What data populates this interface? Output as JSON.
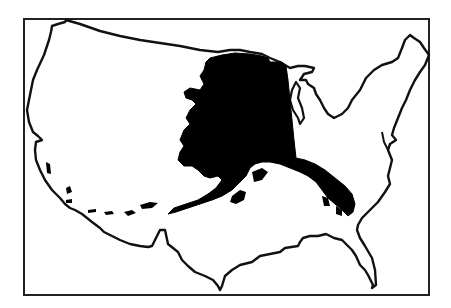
{
  "map": {
    "subject": "Alaska overlaid on the contiguous United States (size comparison)",
    "labels": [],
    "colors": {
      "background": "#ffffff",
      "outline": "#111111",
      "alaska_fill": "#000000",
      "frame": "#222222"
    },
    "frame": {
      "x": 24,
      "y": 19,
      "width": 405,
      "height": 276
    }
  }
}
